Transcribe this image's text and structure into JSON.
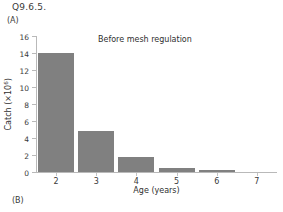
{
  "page": {
    "question_label": "Q9.6.5.",
    "panel_a_label": "(A)",
    "panel_b_label": "(B)"
  },
  "chart_data": {
    "type": "bar",
    "title": "",
    "annotation": "Before mesh regulation",
    "xlabel": "Age (years)",
    "ylabel_text": "Catch (×10",
    "ylabel_exponent": "6",
    "ylabel_suffix": ")",
    "categories": [
      "2",
      "3",
      "4",
      "5",
      "6",
      "7"
    ],
    "values": [
      13.95,
      4.85,
      1.8,
      0.5,
      0.2,
      0.0
    ],
    "ylim": [
      0,
      16
    ],
    "yticks": [
      "0",
      "2",
      "4",
      "6",
      "8",
      "10",
      "12",
      "14",
      "16"
    ],
    "ytick_values": [
      0,
      2,
      4,
      6,
      8,
      10,
      12,
      14,
      16
    ],
    "grid": false,
    "legend": "none",
    "bar_color": "#808080",
    "axis_color": "#b9b9b9",
    "background_color": "#ffffff"
  }
}
